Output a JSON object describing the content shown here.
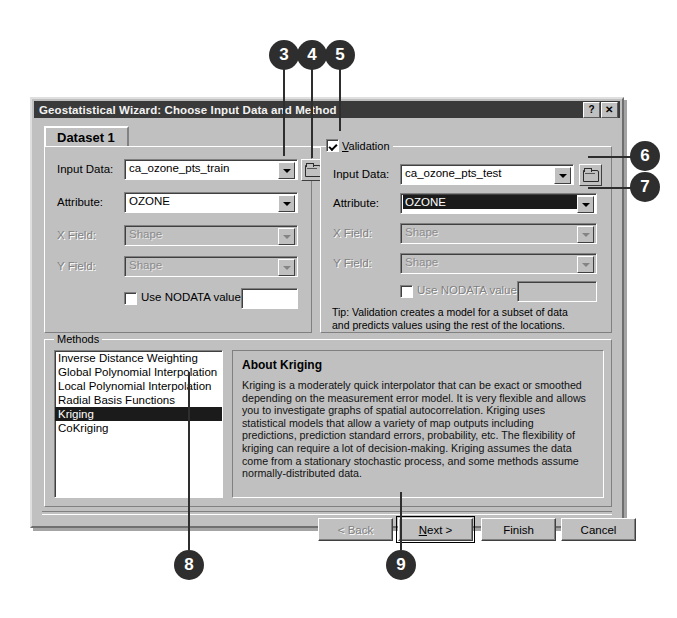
{
  "window": {
    "title": "Geostatistical Wizard: Choose Input Data and Method",
    "help_button": "?",
    "close_button": "✕"
  },
  "tab": {
    "label": "Dataset 1"
  },
  "dataset_panel": {
    "input_data_label": "Input Data:",
    "input_data_value": "ca_ozone_pts_train",
    "attribute_label": "Attribute:",
    "attribute_value": "OZONE",
    "x_field_label": "X Field:",
    "x_field_value": "Shape",
    "y_field_label": "Y Field:",
    "y_field_value": "Shape",
    "nodata_label": "Use NODATA value:",
    "nodata_value": ""
  },
  "validation_panel": {
    "legend": "Validation",
    "legend_accel": "V",
    "legend_rest": "alidation",
    "checked": true,
    "input_data_label": "Input Data:",
    "input_data_value": "ca_ozone_pts_test",
    "attribute_label": "Attribute:",
    "attribute_value": "OZONE",
    "x_field_label": "X Field:",
    "x_field_value": "Shape",
    "y_field_label": "Y Field:",
    "y_field_value": "Shape",
    "nodata_label": "Use NODATA value:",
    "nodata_value": "",
    "tip": "Tip:  Validation creates a model for a subset of data and predicts values using the rest of the locations."
  },
  "methods": {
    "legend": "Methods",
    "items": [
      "Inverse Distance Weighting",
      "Global Polynomial Interpolation",
      "Local Polynomial Interpolation",
      "Radial Basis Functions",
      "Kriging",
      "CoKriging"
    ],
    "selected_index": 4
  },
  "about": {
    "title": "About Kriging",
    "text": "Kriging is a moderately quick interpolator that can be exact or smoothed depending on the measurement error model. It is very flexible and allows you to investigate graphs of spatial autocorrelation. Kriging uses statistical models that allow a variety of map outputs including predictions, prediction standard errors, probability, etc. The flexibility of kriging can require a lot of decision-making. Kriging assumes the data come from a stationary stochastic process, and some methods assume normally-distributed data."
  },
  "buttons": {
    "back": "< Back",
    "next_prefix": "",
    "next_accel": "N",
    "next_rest": "ext >",
    "next": "Next >",
    "finish": "Finish",
    "cancel": "Cancel"
  },
  "callouts": [
    {
      "n": "3"
    },
    {
      "n": "4"
    },
    {
      "n": "5"
    },
    {
      "n": "6"
    },
    {
      "n": "7"
    },
    {
      "n": "8"
    },
    {
      "n": "9"
    }
  ],
  "colors": {
    "dialog_face": "#c0c0c0",
    "titlebar": "#3a3a3a",
    "selection": "#1b1b1b",
    "callout": "#2e2e2e"
  }
}
